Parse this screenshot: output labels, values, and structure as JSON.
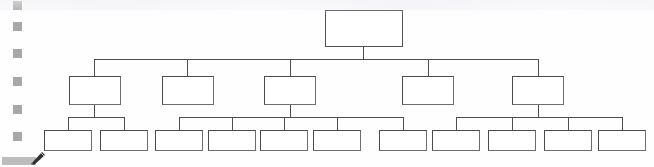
{
  "document": {
    "type": "organization-chart",
    "title": "",
    "background_color": "#ffffff",
    "line_color": "#4d4d4d",
    "box_fill": "#ffffff",
    "box_border": "#4b4b4b",
    "marker_color": "#9a9a9a"
  },
  "gutter": {
    "name": "left-margin-markers",
    "marker_count": 6,
    "markers": [
      {
        "label": "",
        "y": 1
      },
      {
        "label": "",
        "y": 22
      },
      {
        "label": "",
        "y": 49
      },
      {
        "label": "",
        "y": 77
      },
      {
        "label": "",
        "y": 105
      },
      {
        "label": "",
        "y": 132
      }
    ]
  },
  "chart": {
    "levels": 3,
    "root": {
      "label": "",
      "x": 325,
      "y": 10,
      "w": 78,
      "h": 37
    },
    "level2": [
      {
        "label": "",
        "x": 69,
        "y": 76,
        "w": 52,
        "h": 29
      },
      {
        "label": "",
        "x": 162,
        "y": 76,
        "w": 52,
        "h": 29
      },
      {
        "label": "",
        "x": 264,
        "y": 76,
        "w": 52,
        "h": 29
      },
      {
        "label": "",
        "x": 402,
        "y": 76,
        "w": 52,
        "h": 29
      },
      {
        "label": "",
        "x": 512,
        "y": 76,
        "w": 52,
        "h": 29
      }
    ],
    "level3": [
      {
        "label": "",
        "x": 44,
        "y": 130,
        "w": 48,
        "h": 21,
        "parent": 0
      },
      {
        "label": "",
        "x": 100,
        "y": 130,
        "w": 48,
        "h": 21,
        "parent": 0
      },
      {
        "label": "",
        "x": 155,
        "y": 130,
        "w": 48,
        "h": 21,
        "parent": 2
      },
      {
        "label": "",
        "x": 208,
        "y": 130,
        "w": 48,
        "h": 21,
        "parent": 2
      },
      {
        "label": "",
        "x": 260,
        "y": 130,
        "w": 48,
        "h": 21,
        "parent": 2
      },
      {
        "label": "",
        "x": 313,
        "y": 130,
        "w": 48,
        "h": 21,
        "parent": 2
      },
      {
        "label": "",
        "x": 379,
        "y": 130,
        "w": 48,
        "h": 21,
        "parent": 2
      },
      {
        "label": "",
        "x": 432,
        "y": 130,
        "w": 48,
        "h": 21,
        "parent": 4
      },
      {
        "label": "",
        "x": 488,
        "y": 130,
        "w": 48,
        "h": 21,
        "parent": 4
      },
      {
        "label": "",
        "x": 544,
        "y": 130,
        "w": 48,
        "h": 21,
        "parent": 4
      },
      {
        "label": "",
        "x": 598,
        "y": 130,
        "w": 48,
        "h": 21,
        "parent": 4
      }
    ],
    "connectors": {
      "root_stem": {
        "x": 363,
        "y": 47,
        "h": 12
      },
      "level2_bus": {
        "x": 94,
        "y": 59,
        "w": 444
      },
      "level2_drops": [
        94,
        187,
        290,
        428,
        538
      ],
      "group_a_stem": {
        "x": 94,
        "y": 105,
        "h": 12
      },
      "group_a_bus": {
        "x": 68,
        "y": 117,
        "w": 56
      },
      "group_a_drops": [
        68,
        124
      ],
      "group_b_stem": {
        "x": 290,
        "y": 105,
        "h": 12
      },
      "group_b_bus": {
        "x": 179,
        "y": 117,
        "w": 224
      },
      "group_b_drops": [
        179,
        232,
        284,
        337,
        403
      ],
      "group_c_stem": {
        "x": 538,
        "y": 105,
        "h": 12
      },
      "group_c_bus": {
        "x": 456,
        "y": 117,
        "w": 166
      },
      "group_c_drops": [
        456,
        512,
        568,
        622
      ]
    }
  },
  "cursor": {
    "name": "pen-pointer",
    "icon": "pen-cursor-icon",
    "x": 2,
    "y": 150
  }
}
